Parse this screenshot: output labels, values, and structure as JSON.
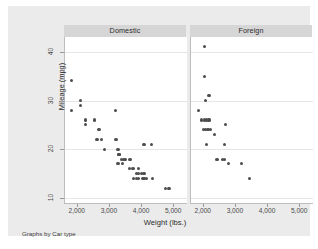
{
  "chart_data": {
    "type": "scatter",
    "title": "",
    "xlabel": "Weight (lbs.)",
    "ylabel": "Mileage (mpg)",
    "note": "Graphs by Car type",
    "grid": true,
    "legend": "none",
    "xlim": [
      1600,
      5400
    ],
    "ylim": [
      9,
      43
    ],
    "xticks": [
      2000,
      3000,
      4000,
      5000
    ],
    "xticklabels": [
      "2,000",
      "3,000",
      "4,000",
      "5,000"
    ],
    "yticks": [
      10,
      20,
      30,
      40
    ],
    "yticklabels": [
      "10",
      "20",
      "30",
      "40"
    ],
    "panels": [
      {
        "label": "Domestic",
        "points": [
          {
            "x": 1800,
            "y": 34
          },
          {
            "x": 1800,
            "y": 28
          },
          {
            "x": 2070,
            "y": 30
          },
          {
            "x": 2070,
            "y": 29
          },
          {
            "x": 2230,
            "y": 26
          },
          {
            "x": 2230,
            "y": 25
          },
          {
            "x": 2520,
            "y": 26
          },
          {
            "x": 2640,
            "y": 24
          },
          {
            "x": 2670,
            "y": 24
          },
          {
            "x": 2580,
            "y": 22
          },
          {
            "x": 2600,
            "y": 22
          },
          {
            "x": 2750,
            "y": 22
          },
          {
            "x": 2830,
            "y": 20
          },
          {
            "x": 3180,
            "y": 28
          },
          {
            "x": 3170,
            "y": 22
          },
          {
            "x": 3200,
            "y": 22
          },
          {
            "x": 3250,
            "y": 20
          },
          {
            "x": 3260,
            "y": 19
          },
          {
            "x": 3280,
            "y": 19
          },
          {
            "x": 3300,
            "y": 19
          },
          {
            "x": 3310,
            "y": 19
          },
          {
            "x": 3350,
            "y": 18
          },
          {
            "x": 3420,
            "y": 18
          },
          {
            "x": 3470,
            "y": 18
          },
          {
            "x": 3600,
            "y": 18
          },
          {
            "x": 3630,
            "y": 18
          },
          {
            "x": 3250,
            "y": 17
          },
          {
            "x": 3400,
            "y": 17
          },
          {
            "x": 3600,
            "y": 16
          },
          {
            "x": 3700,
            "y": 16
          },
          {
            "x": 3730,
            "y": 16
          },
          {
            "x": 3900,
            "y": 16
          },
          {
            "x": 3840,
            "y": 15
          },
          {
            "x": 3900,
            "y": 15
          },
          {
            "x": 3990,
            "y": 15
          },
          {
            "x": 4060,
            "y": 15
          },
          {
            "x": 3740,
            "y": 14
          },
          {
            "x": 3830,
            "y": 14
          },
          {
            "x": 3900,
            "y": 14
          },
          {
            "x": 4030,
            "y": 14
          },
          {
            "x": 4060,
            "y": 14
          },
          {
            "x": 4130,
            "y": 14
          },
          {
            "x": 4330,
            "y": 14
          },
          {
            "x": 4060,
            "y": 21
          },
          {
            "x": 4290,
            "y": 21
          },
          {
            "x": 4720,
            "y": 12
          },
          {
            "x": 4840,
            "y": 12
          }
        ]
      },
      {
        "label": "Foreign",
        "points": [
          {
            "x": 2020,
            "y": 41
          },
          {
            "x": 2020,
            "y": 35
          },
          {
            "x": 2160,
            "y": 31
          },
          {
            "x": 2050,
            "y": 30
          },
          {
            "x": 1830,
            "y": 28
          },
          {
            "x": 1930,
            "y": 26
          },
          {
            "x": 2020,
            "y": 26
          },
          {
            "x": 2070,
            "y": 26
          },
          {
            "x": 2160,
            "y": 26
          },
          {
            "x": 2670,
            "y": 25
          },
          {
            "x": 1990,
            "y": 24
          },
          {
            "x": 2040,
            "y": 24
          },
          {
            "x": 2130,
            "y": 24
          },
          {
            "x": 2200,
            "y": 24
          },
          {
            "x": 2330,
            "y": 23
          },
          {
            "x": 2070,
            "y": 21
          },
          {
            "x": 2650,
            "y": 21
          },
          {
            "x": 2410,
            "y": 18
          },
          {
            "x": 2590,
            "y": 18
          },
          {
            "x": 2650,
            "y": 18
          },
          {
            "x": 2780,
            "y": 17
          },
          {
            "x": 3170,
            "y": 17
          },
          {
            "x": 3420,
            "y": 14
          }
        ]
      }
    ]
  }
}
